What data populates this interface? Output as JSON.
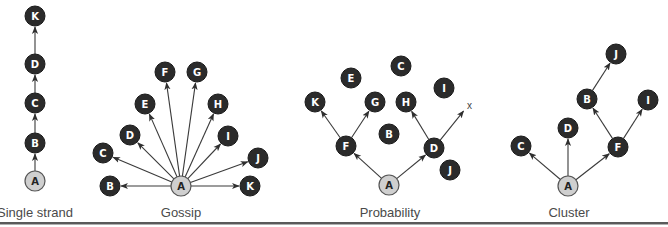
{
  "diagrams": [
    {
      "id": "single-strand",
      "caption": "Single strand",
      "caption_pos": [
        35,
        217
      ],
      "root": "A",
      "nodes": [
        {
          "id": "A",
          "x": 35,
          "y": 181,
          "root": true
        },
        {
          "id": "B",
          "x": 35,
          "y": 143
        },
        {
          "id": "C",
          "x": 35,
          "y": 103
        },
        {
          "id": "D",
          "x": 35,
          "y": 64
        },
        {
          "id": "K",
          "x": 35,
          "y": 16
        }
      ],
      "edges": [
        [
          "A",
          "B"
        ],
        [
          "B",
          "C"
        ],
        [
          "C",
          "D"
        ],
        [
          "D",
          "K"
        ]
      ]
    },
    {
      "id": "gossip",
      "caption": "Gossip",
      "caption_pos": [
        181,
        217
      ],
      "root": "A",
      "nodes": [
        {
          "id": "A",
          "x": 181,
          "y": 186,
          "root": true
        },
        {
          "id": "B",
          "x": 110,
          "y": 186
        },
        {
          "id": "C",
          "x": 103,
          "y": 153
        },
        {
          "id": "D",
          "x": 130,
          "y": 135
        },
        {
          "id": "E",
          "x": 145,
          "y": 104
        },
        {
          "id": "F",
          "x": 165,
          "y": 72
        },
        {
          "id": "G",
          "x": 197,
          "y": 72
        },
        {
          "id": "H",
          "x": 218,
          "y": 104
        },
        {
          "id": "I",
          "x": 228,
          "y": 136
        },
        {
          "id": "J",
          "x": 258,
          "y": 158
        },
        {
          "id": "K",
          "x": 250,
          "y": 186
        }
      ],
      "edges": [
        [
          "A",
          "B"
        ],
        [
          "A",
          "C"
        ],
        [
          "A",
          "D"
        ],
        [
          "A",
          "E"
        ],
        [
          "A",
          "F"
        ],
        [
          "A",
          "G"
        ],
        [
          "A",
          "H"
        ],
        [
          "A",
          "I"
        ],
        [
          "A",
          "J"
        ],
        [
          "A",
          "K"
        ]
      ]
    },
    {
      "id": "probability",
      "caption": "Probability",
      "caption_pos": [
        390,
        217
      ],
      "root": "A",
      "nodes": [
        {
          "id": "A",
          "x": 389,
          "y": 185,
          "root": true
        },
        {
          "id": "B",
          "x": 389,
          "y": 134
        },
        {
          "id": "C",
          "x": 401,
          "y": 66
        },
        {
          "id": "D",
          "x": 434,
          "y": 148
        },
        {
          "id": "E",
          "x": 351,
          "y": 78
        },
        {
          "id": "F",
          "x": 346,
          "y": 146
        },
        {
          "id": "G",
          "x": 375,
          "y": 102
        },
        {
          "id": "H",
          "x": 406,
          "y": 102
        },
        {
          "id": "I",
          "x": 444,
          "y": 88
        },
        {
          "id": "J",
          "x": 450,
          "y": 170
        },
        {
          "id": "K",
          "x": 315,
          "y": 102
        }
      ],
      "edges": [
        [
          "A",
          "F"
        ],
        [
          "A",
          "D"
        ],
        [
          "F",
          "K"
        ],
        [
          "F",
          "G"
        ],
        [
          "D",
          "H"
        ],
        [
          "D",
          "x"
        ]
      ],
      "dead_end": {
        "label": "x",
        "x": 466,
        "y": 108
      }
    },
    {
      "id": "cluster",
      "caption": "Cluster",
      "caption_pos": [
        569,
        217
      ],
      "root": "A",
      "nodes": [
        {
          "id": "A",
          "x": 568,
          "y": 186,
          "root": true
        },
        {
          "id": "B",
          "x": 587,
          "y": 99
        },
        {
          "id": "C",
          "x": 521,
          "y": 146
        },
        {
          "id": "D",
          "x": 568,
          "y": 128
        },
        {
          "id": "F",
          "x": 618,
          "y": 147
        },
        {
          "id": "I",
          "x": 648,
          "y": 100
        },
        {
          "id": "J",
          "x": 616,
          "y": 54
        }
      ],
      "edges": [
        [
          "A",
          "C"
        ],
        [
          "A",
          "D"
        ],
        [
          "A",
          "F"
        ],
        [
          "F",
          "B"
        ],
        [
          "F",
          "I"
        ],
        [
          "B",
          "J"
        ]
      ]
    }
  ],
  "style": {
    "node_dark": "#2b2b2b",
    "node_root": "#cfcfcf",
    "edge": "#3a3a3a",
    "caption": "#4a4a4a"
  }
}
